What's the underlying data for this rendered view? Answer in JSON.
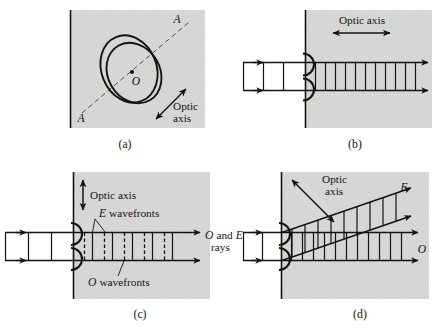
{
  "figure": {
    "background_color": "#ffffff",
    "crystal_fill_color": "#d9d9d9",
    "ink_color": "#15130f"
  },
  "panels": [
    {
      "id": "panel-a",
      "label": "(a)",
      "description": "Calcite crystal face showing the optic axis through the blunt corner",
      "annotations": {
        "axis_end_top": "A",
        "axis_end_bottom": "A",
        "center_point": "O",
        "optic_axis_line1": "Optic",
        "optic_axis_line2": "axis"
      }
    },
    {
      "id": "panel-b",
      "label": "(b)",
      "description": "Light travelling parallel to the optic axis; O and E wavefronts coincide",
      "annotations": {
        "optic_axis": "Optic axis"
      }
    },
    {
      "id": "panel-c",
      "label": "(c)",
      "description": "Optic axis perpendicular to propagation; O and E wavefronts separate but rays coincide",
      "annotations": {
        "optic_axis": "Optic axis",
        "e_wavefronts": "E wavefronts",
        "e_wavefronts_italic": "E",
        "o_wavefronts": "O wavefronts",
        "o_wavefronts_italic": "O",
        "rays_line1_a": "O",
        "rays_line1_mid": "and",
        "rays_line1_b": "E",
        "rays_line2": "rays"
      }
    },
    {
      "id": "panel-d",
      "label": "(d)",
      "description": "Optic axis oblique; the E ray walks off from the O ray",
      "annotations": {
        "optic_axis_line1": "Optic",
        "optic_axis_line2": "axis",
        "e_ray": "E",
        "o_ray": "O"
      }
    }
  ]
}
